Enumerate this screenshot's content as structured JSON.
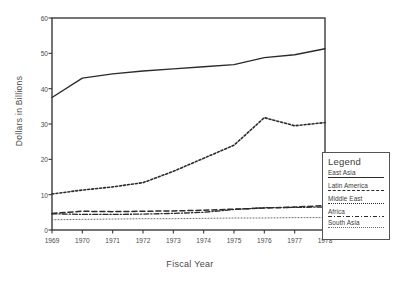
{
  "chart_data": {
    "type": "line",
    "title": "",
    "xlabel": "Fiscal Year",
    "ylabel": "Dollars in Billions",
    "x": [
      1969,
      1970,
      1971,
      1972,
      1973,
      1974,
      1975,
      1976,
      1977,
      1978
    ],
    "xticklabels": [
      "1969",
      "1970",
      "1971",
      "1972",
      "1973",
      "1974",
      "1975",
      "1976",
      "1977",
      "1978"
    ],
    "yticklabels": [
      "0",
      "10",
      "20",
      "30",
      "40",
      "50",
      "60"
    ],
    "yticks": [
      0,
      10,
      20,
      30,
      40,
      50,
      60
    ],
    "xlim": [
      1969,
      1978
    ],
    "ylim": [
      0,
      60
    ],
    "grid": false,
    "legend_position": "right-outside",
    "legend_title": "Legend",
    "series": [
      {
        "name": "East Asia",
        "style": "solid",
        "values": [
          37.5,
          43.0,
          44.2,
          45.0,
          45.6,
          46.2,
          46.8,
          48.8,
          49.6,
          51.3
        ]
      },
      {
        "name": "Latin America",
        "style": "dashed",
        "values": [
          4.7,
          5.3,
          5.2,
          5.3,
          5.4,
          5.6,
          5.9,
          6.2,
          6.5,
          6.9
        ]
      },
      {
        "name": "Middle East",
        "style": "dotted",
        "values": [
          10.2,
          11.3,
          12.2,
          13.4,
          16.6,
          20.3,
          24.0,
          31.8,
          29.5,
          30.4
        ]
      },
      {
        "name": "Africa",
        "style": "dash-dot",
        "values": [
          4.6,
          4.4,
          4.4,
          4.5,
          4.7,
          5.0,
          5.8,
          6.3,
          6.4,
          6.5
        ]
      },
      {
        "name": "South Asia",
        "style": "fine-dotted",
        "values": [
          2.9,
          3.0,
          3.1,
          3.2,
          3.2,
          3.3,
          3.4,
          3.4,
          3.5,
          3.5
        ]
      }
    ]
  }
}
